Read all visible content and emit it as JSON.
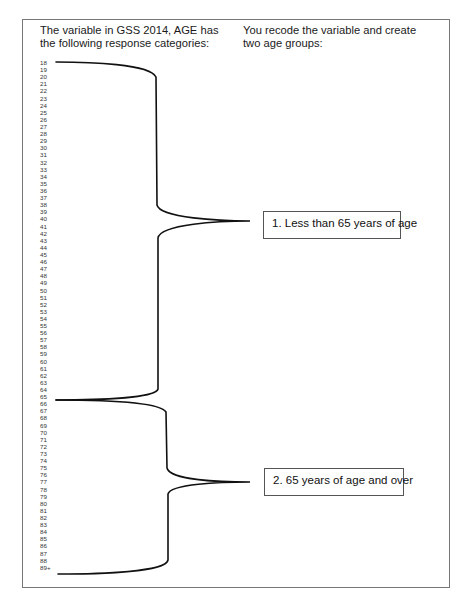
{
  "headings": {
    "left": "The variable in GSS 2014, AGE has the following response categories:",
    "right": "You recode the variable and create two age groups:"
  },
  "age_categories": [
    "18",
    "19",
    "20",
    "21",
    "22",
    "23",
    "24",
    "25",
    "26",
    "27",
    "28",
    "29",
    "30",
    "31",
    "32",
    "33",
    "34",
    "35",
    "36",
    "37",
    "38",
    "39",
    "40",
    "41",
    "42",
    "43",
    "44",
    "45",
    "46",
    "47",
    "48",
    "49",
    "50",
    "51",
    "52",
    "53",
    "54",
    "55",
    "56",
    "57",
    "58",
    "59",
    "60",
    "61",
    "62",
    "63",
    "64",
    "65",
    "66",
    "67",
    "68",
    "69",
    "70",
    "71",
    "72",
    "73",
    "74",
    "75",
    "76",
    "77",
    "78",
    "79",
    "80",
    "81",
    "82",
    "83",
    "84",
    "85",
    "86",
    "87",
    "88",
    "89+"
  ],
  "groups": [
    {
      "label": "1. Less than 65 years of age",
      "range_start": "18",
      "range_end": "65"
    },
    {
      "label": "2. 65 years of age and over",
      "range_start": "65",
      "range_end": "89+"
    }
  ]
}
